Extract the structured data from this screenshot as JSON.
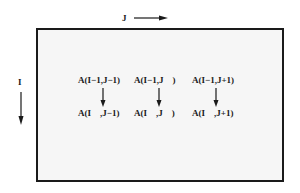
{
  "axes": {
    "j_label": "J",
    "i_label": "I"
  },
  "top_row": [
    "A(I−1,J−1)",
    "A(I−1,J    )",
    "A(I−1,J+1)"
  ],
  "bottom_row": [
    "A(I    ,J−1)",
    "A(I    ,J    )",
    "A(I    ,J+1)"
  ],
  "colors": {
    "line": "#1a1a1a",
    "box_fill": "#f6f6f6"
  }
}
